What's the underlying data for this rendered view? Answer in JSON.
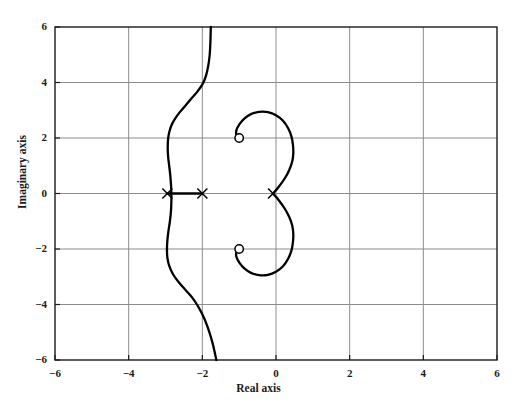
{
  "chart_data": {
    "type": "line",
    "title": "",
    "subtitle": "",
    "xlabel": "Real axis",
    "ylabel": "Imaginary axis",
    "xlim": [
      -6,
      6
    ],
    "ylim": [
      -6,
      6
    ],
    "xticks": [
      -6,
      -4,
      -2,
      0,
      2,
      4,
      6
    ],
    "yticks": [
      -6,
      -4,
      -2,
      0,
      2,
      4,
      6
    ],
    "xtick_labels": [
      "−6",
      "−4",
      "−2",
      "0",
      "2",
      "4",
      "6"
    ],
    "ytick_labels": [
      "−6",
      "−4",
      "−2",
      "0",
      "2",
      "4",
      "6"
    ],
    "grid": true,
    "legend": "none",
    "line_color": "#000000",
    "grid_color": "#8c8c8c",
    "axis_color": "#1b1b1b",
    "poles": [
      {
        "marker": "x",
        "real": -2.95,
        "imag": 0.0,
        "label": "pole-1"
      },
      {
        "marker": "x",
        "real": -2.0,
        "imag": 0.0,
        "label": "pole-2"
      },
      {
        "marker": "x",
        "real": -0.08,
        "imag": 0.0,
        "label": "pole-3"
      }
    ],
    "zeros": [
      {
        "marker": "o",
        "real": -1.0,
        "imag": 2.0,
        "label": "zero-1"
      },
      {
        "marker": "o",
        "real": -1.0,
        "imag": -2.0,
        "label": "zero-2"
      }
    ],
    "real_axis_segments": [
      {
        "from": -2.95,
        "to": -2.0,
        "imag": 0.0
      }
    ],
    "series": [
      {
        "name": "left-branch",
        "points": [
          [
            -1.62,
            -6.0
          ],
          [
            -1.72,
            -5.4
          ],
          [
            -1.86,
            -4.8
          ],
          [
            -2.02,
            -4.3
          ],
          [
            -2.22,
            -3.85
          ],
          [
            -2.44,
            -3.5
          ],
          [
            -2.64,
            -3.2
          ],
          [
            -2.8,
            -2.9
          ],
          [
            -2.9,
            -2.6
          ],
          [
            -2.95,
            -2.3
          ],
          [
            -2.96,
            -2.0
          ],
          [
            -2.95,
            -1.7
          ],
          [
            -2.92,
            -1.35
          ],
          [
            -2.88,
            -1.0
          ],
          [
            -2.85,
            -0.6
          ],
          [
            -2.84,
            -0.25
          ],
          [
            -2.84,
            0.0
          ],
          [
            -2.85,
            0.3
          ],
          [
            -2.87,
            0.65
          ],
          [
            -2.9,
            1.0
          ],
          [
            -2.93,
            1.35
          ],
          [
            -2.94,
            1.65
          ],
          [
            -2.93,
            1.95
          ],
          [
            -2.9,
            2.2
          ],
          [
            -2.84,
            2.45
          ],
          [
            -2.74,
            2.7
          ],
          [
            -2.6,
            2.95
          ],
          [
            -2.44,
            3.2
          ],
          [
            -2.28,
            3.45
          ],
          [
            -2.12,
            3.7
          ],
          [
            -1.99,
            3.95
          ],
          [
            -1.9,
            4.25
          ],
          [
            -1.84,
            4.6
          ],
          [
            -1.8,
            5.0
          ],
          [
            -1.78,
            5.5
          ],
          [
            -1.77,
            6.0
          ]
        ]
      },
      {
        "name": "upper-loop-branch",
        "points": [
          [
            -0.08,
            0.0
          ],
          [
            0.08,
            0.25
          ],
          [
            0.24,
            0.55
          ],
          [
            0.36,
            0.85
          ],
          [
            0.44,
            1.15
          ],
          [
            0.47,
            1.45
          ],
          [
            0.46,
            1.75
          ],
          [
            0.42,
            2.05
          ],
          [
            0.33,
            2.35
          ],
          [
            0.19,
            2.62
          ],
          [
            0.0,
            2.82
          ],
          [
            -0.22,
            2.93
          ],
          [
            -0.46,
            2.94
          ],
          [
            -0.68,
            2.86
          ],
          [
            -0.86,
            2.7
          ],
          [
            -0.99,
            2.5
          ],
          [
            -1.07,
            2.3
          ],
          [
            -1.08,
            2.13
          ],
          [
            -1.03,
            2.02
          ],
          [
            -0.95,
            1.99
          ]
        ]
      },
      {
        "name": "lower-loop-branch",
        "points": [
          [
            -0.08,
            0.0
          ],
          [
            0.08,
            -0.25
          ],
          [
            0.24,
            -0.55
          ],
          [
            0.36,
            -0.85
          ],
          [
            0.44,
            -1.15
          ],
          [
            0.47,
            -1.45
          ],
          [
            0.46,
            -1.75
          ],
          [
            0.42,
            -2.05
          ],
          [
            0.33,
            -2.35
          ],
          [
            0.19,
            -2.62
          ],
          [
            0.0,
            -2.82
          ],
          [
            -0.22,
            -2.93
          ],
          [
            -0.46,
            -2.94
          ],
          [
            -0.68,
            -2.86
          ],
          [
            -0.86,
            -2.7
          ],
          [
            -0.99,
            -2.5
          ],
          [
            -1.07,
            -2.3
          ],
          [
            -1.08,
            -2.13
          ],
          [
            -1.03,
            -2.02
          ],
          [
            -0.95,
            -1.99
          ]
        ]
      }
    ]
  },
  "axes": {
    "xlabel": "Real axis",
    "ylabel": "Imaginary axis"
  }
}
